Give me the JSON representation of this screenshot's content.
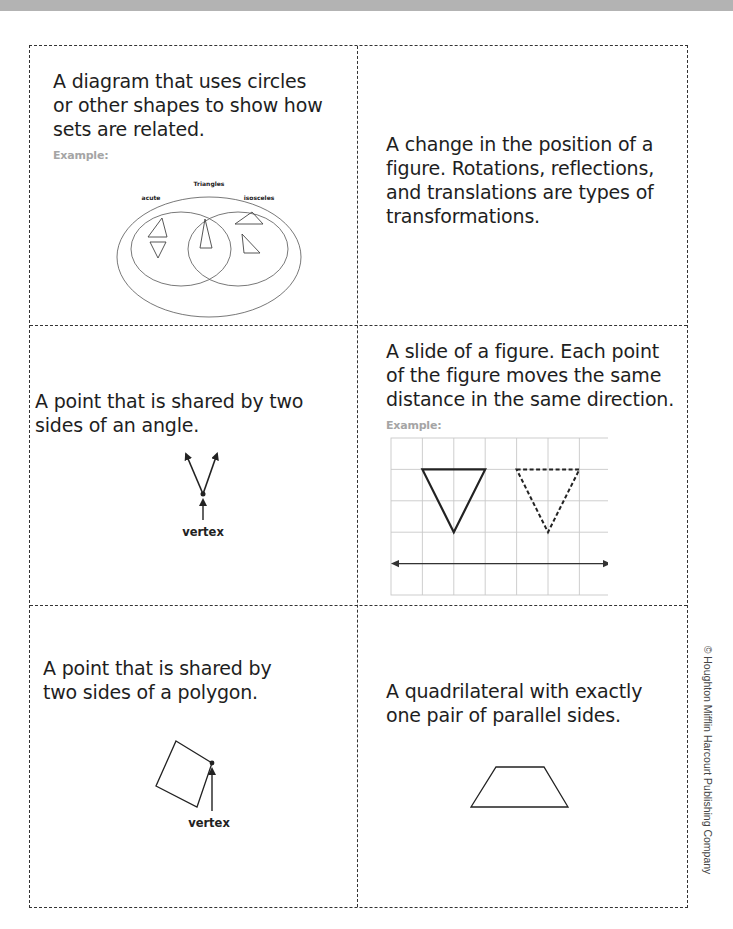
{
  "cards": [
    {
      "id": "venn-diagram",
      "definition": "A diagram that uses circles or other shapes to show how sets are related.",
      "lines": [
        "A diagram that uses circles",
        "or other shapes to show how",
        "sets are related."
      ],
      "example_label": "Example:",
      "figure": {
        "outer_label": "Triangles",
        "left_label": "acute",
        "right_label": "isosceles"
      }
    },
    {
      "id": "transformation",
      "definition": "A change in the position of a figure. Rotations, reflections, and translations are types of transformations.",
      "lines": [
        "A change in the position of a",
        "figure. Rotations, reflections,",
        "and translations are types of",
        "transformations."
      ]
    },
    {
      "id": "vertex-angle",
      "definition": "A point that is shared by two sides of an angle.",
      "lines": [
        "A point that is shared by two",
        "sides of an angle."
      ],
      "figure": {
        "label": "vertex"
      }
    },
    {
      "id": "translation",
      "definition": "A slide of a figure. Each point of the figure moves the same distance in the same direction.",
      "lines": [
        "A slide of a figure. Each point",
        "of the figure moves the same",
        "distance in the same direction."
      ],
      "example_label": "Example:"
    },
    {
      "id": "vertex-polygon",
      "definition": "A point that is shared by two sides of a polygon.",
      "lines": [
        "A point that is shared by",
        "two sides of a polygon."
      ],
      "figure": {
        "label": "vertex"
      }
    },
    {
      "id": "trapezoid",
      "definition": "A quadrilateral with exactly one pair of parallel sides.",
      "lines": [
        "A quadrilateral with exactly",
        "one pair of parallel sides."
      ]
    }
  ],
  "copyright": "© Houghton Mifflin Harcourt Publishing Company",
  "colors": {
    "top_bar": "#b3b3b3",
    "border": "#333333",
    "example_label": "#a5a5a5",
    "grid": "#c8c8c8"
  }
}
